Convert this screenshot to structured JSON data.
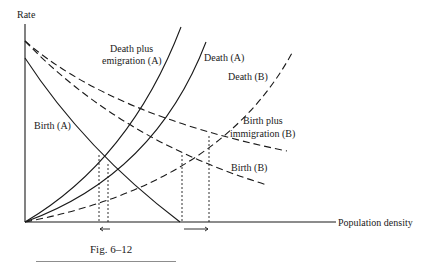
{
  "figure": {
    "caption": "Fig. 6–12",
    "y_axis_label": "Rate",
    "x_axis_label": "Population density",
    "curves": {
      "birth_a": {
        "label": "Birth (A)",
        "style": "solid"
      },
      "death_plus_emigration_a": {
        "label_line1": "Death plus",
        "label_line2": "emigration (A)",
        "style": "solid"
      },
      "death_a": {
        "label": "Death (A)",
        "style": "solid"
      },
      "death_b": {
        "label": "Death (B)",
        "style": "dashed"
      },
      "birth_plus_immigration_b": {
        "label_line1": "Birth plus",
        "label_line2": "immigration (B)",
        "style": "dashed"
      },
      "birth_b": {
        "label": "Birth (B)",
        "style": "dashed"
      }
    },
    "equilibrium_markers": {
      "population_a": {
        "direction": "left",
        "arrow": "←"
      },
      "population_b": {
        "direction": "right",
        "arrow": "→"
      }
    },
    "line_color": "#1a1a1a"
  }
}
